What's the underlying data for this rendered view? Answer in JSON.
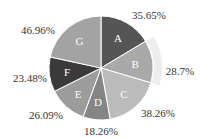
{
  "chart_data": {
    "type": "pie",
    "title": "",
    "start_angle": "top, clockwise",
    "highlighted_slice": "B",
    "slices": [
      {
        "label": "A",
        "value": 35.65,
        "display": "35.65%",
        "color": "#555555"
      },
      {
        "label": "B",
        "value": 28.7,
        "display": "28.7%",
        "color": "#a9a9a9"
      },
      {
        "label": "C",
        "value": 38.26,
        "display": "38.26%",
        "color": "#bbbbbb"
      },
      {
        "label": "D",
        "value": 18.26,
        "display": "18.26%",
        "color": "#858585"
      },
      {
        "label": "E",
        "value": 26.09,
        "display": "26.09%",
        "color": "#9c9c9c"
      },
      {
        "label": "F",
        "value": 23.48,
        "display": "23.48%",
        "color": "#3a3a3a"
      },
      {
        "label": "G",
        "value": 46.96,
        "display": "46.96%",
        "color": "#a3a3a3"
      }
    ],
    "label_positions": [
      {
        "x": 149,
        "y": 15
      },
      {
        "x": 180,
        "y": 71
      },
      {
        "x": 158,
        "y": 113
      },
      {
        "x": 101,
        "y": 131
      },
      {
        "x": 46,
        "y": 115
      },
      {
        "x": 30,
        "y": 78
      },
      {
        "x": 38,
        "y": 30
      }
    ]
  }
}
